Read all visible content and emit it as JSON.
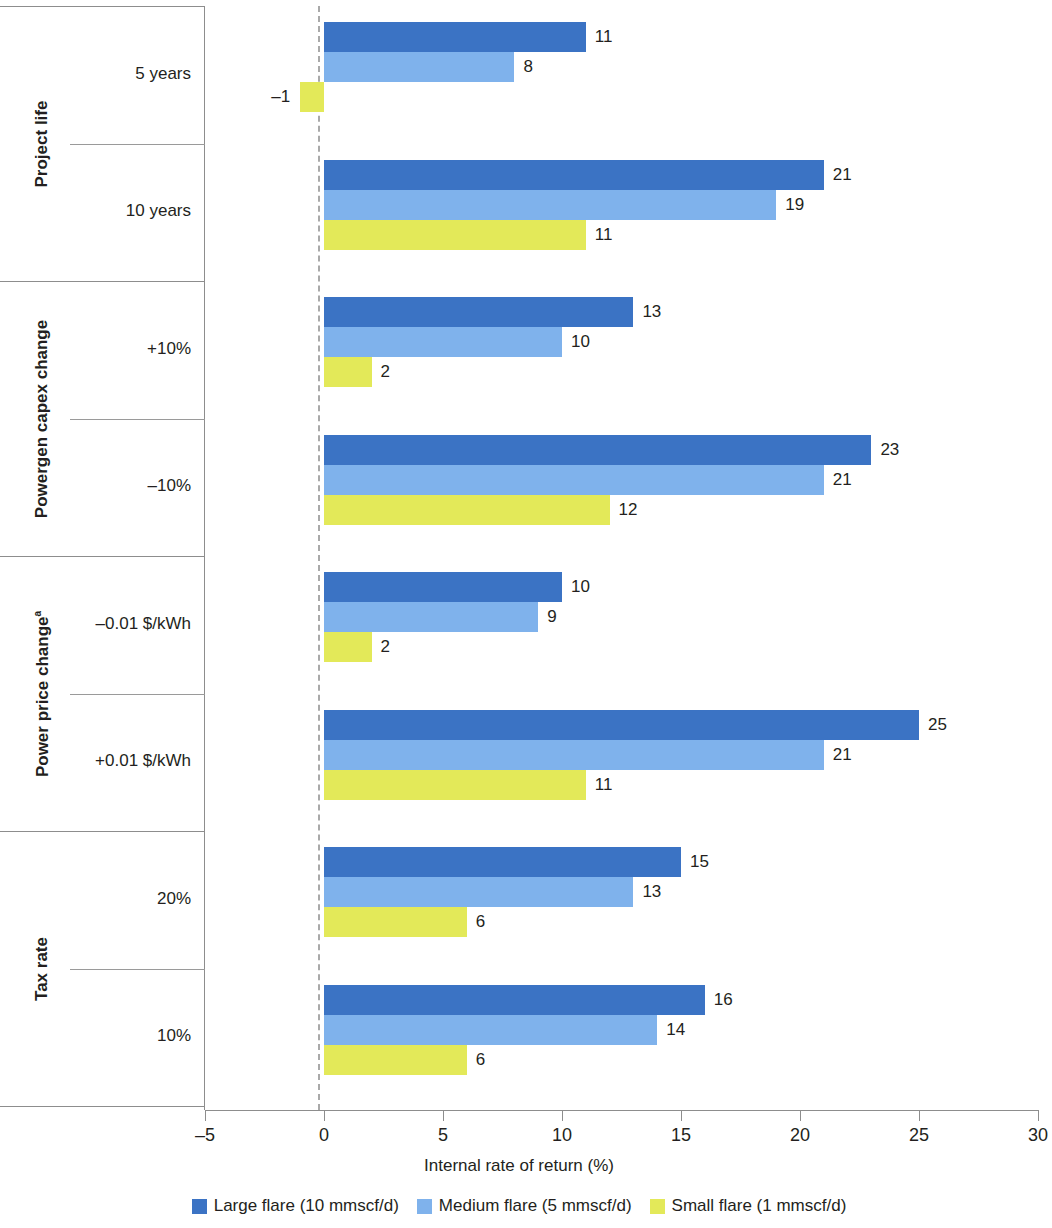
{
  "chart_data": {
    "type": "bar",
    "orientation": "horizontal",
    "title": "",
    "xlabel": "Internal rate of return (%)",
    "ylabel": "",
    "xlim": [
      -5,
      30
    ],
    "xticks": [
      -5,
      0,
      5,
      10,
      15,
      20,
      25,
      30
    ],
    "xtick_labels": [
      "–5",
      "0",
      "5",
      "10",
      "15",
      "20",
      "25",
      "30"
    ],
    "grid": false,
    "zero_reference_line": true,
    "legend_position": "bottom",
    "categories": [
      "5 years",
      "10 years",
      "+10%",
      "–10%",
      "–0.01 $/kWh",
      "+0.01 $/kWh",
      "20%",
      "10%"
    ],
    "category_groups": [
      {
        "title": "Project life",
        "footnote": "",
        "categories": [
          "5 years",
          "10 years"
        ]
      },
      {
        "title": "Powergen capex change",
        "footnote": "",
        "categories": [
          "+10%",
          "–10%"
        ]
      },
      {
        "title": "Power price change",
        "footnote": "a",
        "categories": [
          "–0.01 $/kWh",
          "+0.01 $/kWh"
        ]
      },
      {
        "title": "Tax rate",
        "footnote": "",
        "categories": [
          "20%",
          "10%"
        ]
      }
    ],
    "series": [
      {
        "name": "Large flare (10 mmscf/d)",
        "color": "#3b73c4",
        "values": [
          11,
          21,
          13,
          23,
          10,
          25,
          15,
          16
        ],
        "labels": [
          "11",
          "21",
          "13",
          "23",
          "10",
          "25",
          "15",
          "16"
        ]
      },
      {
        "name": "Medium flare (5 mmscf/d)",
        "color": "#7fb2ec",
        "values": [
          8,
          19,
          10,
          21,
          9,
          21,
          13,
          14
        ],
        "labels": [
          "8",
          "19",
          "10",
          "21",
          "9",
          "21",
          "13",
          "14"
        ]
      },
      {
        "name": "Small flare (1 mmscf/d)",
        "color": "#e3e959",
        "values": [
          -1,
          11,
          2,
          12,
          2,
          11,
          6,
          6
        ],
        "labels": [
          "–1",
          "11",
          "2",
          "12",
          "2",
          "11",
          "6",
          "6"
        ]
      }
    ]
  },
  "axis": {
    "x_title": "Internal rate of return (%)",
    "ticks": [
      {
        "value": -5,
        "label": "–5"
      },
      {
        "value": 0,
        "label": "0"
      },
      {
        "value": 5,
        "label": "5"
      },
      {
        "value": 10,
        "label": "10"
      },
      {
        "value": 15,
        "label": "15"
      },
      {
        "value": 20,
        "label": "20"
      },
      {
        "value": 25,
        "label": "25"
      },
      {
        "value": 30,
        "label": "30"
      }
    ]
  },
  "groups": [
    {
      "title": "Project life",
      "footnote": "",
      "rows": [
        {
          "label": "5 years"
        },
        {
          "label": "10 years"
        }
      ]
    },
    {
      "title": "Powergen capex change",
      "footnote": "",
      "rows": [
        {
          "label": "+10%"
        },
        {
          "label": "–10%"
        }
      ]
    },
    {
      "title": "Power price change",
      "footnote": "a",
      "rows": [
        {
          "label": "–0.01 $/kWh"
        },
        {
          "label": "+0.01 $/kWh"
        }
      ]
    },
    {
      "title": "Tax rate",
      "footnote": "",
      "rows": [
        {
          "label": "20%"
        },
        {
          "label": "10%"
        }
      ]
    }
  ],
  "legend": {
    "items": [
      {
        "label": "Large flare (10 mmscf/d)",
        "color": "#3b73c4"
      },
      {
        "label": "Medium flare (5 mmscf/d)",
        "color": "#7fb2ec"
      },
      {
        "label": "Small flare (1 mmscf/d)",
        "color": "#e3e959"
      }
    ]
  },
  "colors": {
    "large_flare": "#3b73c4",
    "medium_flare": "#7fb2ec",
    "small_flare": "#e3e959",
    "axis": "#8d8d8d",
    "text": "#231f20",
    "zero_line": "#a9a9a9"
  }
}
